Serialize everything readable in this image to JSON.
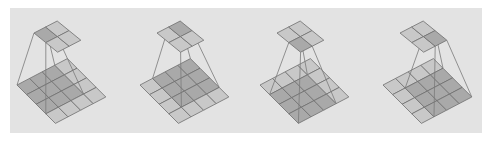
{
  "figure": {
    "input_size": 4,
    "kernel_size": 3,
    "output_size": 2,
    "colors": {
      "background": "#e3e3e3",
      "cell_light": "#c8c8c8",
      "cell_dark": "#a9a9a9",
      "grid_line": "#6e6e6e",
      "projection_line": "#7a7a7a"
    },
    "panels": [
      {
        "label": "step-1",
        "active_output": [
          0,
          0
        ],
        "x_offset": 0
      },
      {
        "label": "step-2",
        "active_output": [
          0,
          1
        ],
        "x_offset": 123
      },
      {
        "label": "step-3",
        "active_output": [
          1,
          0
        ],
        "x_offset": 243
      },
      {
        "label": "step-4",
        "active_output": [
          1,
          1
        ],
        "x_offset": 366
      }
    ]
  }
}
